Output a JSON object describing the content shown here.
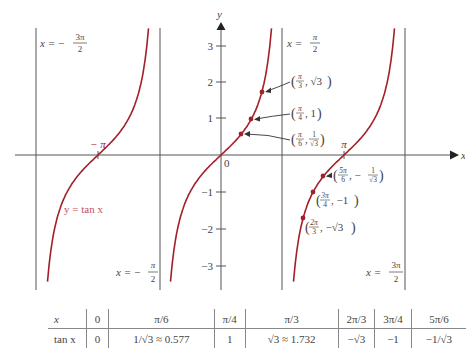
{
  "chart_data": {
    "type": "line",
    "title": "",
    "function": "y = tan x",
    "xlabel": "x",
    "ylabel": "y",
    "xlim": [
      -4.96,
      7.59
    ],
    "ylim": [
      -3.4,
      3.3
    ],
    "grid": false,
    "y_ticks": [
      -3,
      -2,
      -1,
      1,
      2,
      3
    ],
    "x_tick_labels": [
      "-π",
      "0",
      "π"
    ],
    "asymptotes": [
      {
        "x": -4.712,
        "label_lhs": "x =",
        "label_rhs": "−3π/2"
      },
      {
        "x": -1.571,
        "label_lhs": "x =",
        "label_rhs": "−π/2"
      },
      {
        "x": 1.571,
        "label_lhs": "x =",
        "label_rhs": "π/2"
      },
      {
        "x": 4.712,
        "label_lhs": "x =",
        "label_rhs": "3π/2"
      }
    ],
    "curve_label": "y = tan x",
    "curve_color": "#a3202a",
    "highlighted_points": [
      {
        "x": 0.5236,
        "y": 0.577,
        "label": "(π/6, 1/√3)"
      },
      {
        "x": 0.7854,
        "y": 1.0,
        "label": "(π/4, 1)"
      },
      {
        "x": 1.0472,
        "y": 1.732,
        "label": "(π/3, √3)"
      },
      {
        "x": 2.0944,
        "y": -1.732,
        "label": "(2π/3, −√3)"
      },
      {
        "x": 2.3562,
        "y": -1.0,
        "label": "(3π/4, −1)"
      },
      {
        "x": 2.618,
        "y": -0.577,
        "label": "(5π/6, −1/√3)"
      }
    ],
    "table": {
      "headers": [
        "x",
        "0",
        "π/6",
        "π/4",
        "π/3",
        "2π/3",
        "3π/4",
        "5π/6"
      ],
      "rows": [
        [
          "tan x",
          "0",
          "1/√3 ≈ 0.577",
          "1",
          "√3 ≈ 1.732",
          "−√3",
          "−1",
          "−1/√3"
        ]
      ]
    }
  },
  "labels": {
    "x_axis": "x",
    "y_axis": "y",
    "origin": "0",
    "neg_pi": "− π",
    "pi": "π",
    "y_ticks": [
      "3",
      "2",
      "1",
      "−1",
      "−2",
      "−3"
    ],
    "curve": "y  =  tan x",
    "asym1": {
      "lhs": "x  =  −",
      "num": "3π",
      "den": "2"
    },
    "asym2": {
      "lhs": "x  =  −",
      "num": "π",
      "den": "2"
    },
    "asym3": {
      "lhs": "x  =",
      "num": "π",
      "den": "2"
    },
    "asym4": {
      "lhs": "x  =",
      "num": "3π",
      "den": "2"
    },
    "pts": {
      "p1": {
        "num": "π",
        "den": "3",
        "rest": ", √3"
      },
      "p2": {
        "num": "π",
        "den": "4",
        "rest": ", 1"
      },
      "p3": {
        "num": "π",
        "den": "6",
        "rest": ",",
        "num2": "1",
        "den2": "√3"
      },
      "p4": {
        "num": "5π",
        "den": "6",
        "rest": ", −",
        "num2": "1",
        "den2": "√3"
      },
      "p5": {
        "num": "3π",
        "den": "4",
        "rest": ", −1"
      },
      "p6": {
        "num": "2π",
        "den": "3",
        "rest": ", −√3"
      }
    }
  },
  "table": {
    "headers": [
      "x",
      "0",
      "π/6",
      "π/4",
      "π/3",
      "2π/3",
      "3π/4",
      "5π/6"
    ],
    "row": [
      "tan x",
      "0",
      "1/√3 ≈ 0.577",
      "1",
      "√3 ≈ 1.732",
      "−√3",
      "−1",
      "−1/√3"
    ]
  }
}
